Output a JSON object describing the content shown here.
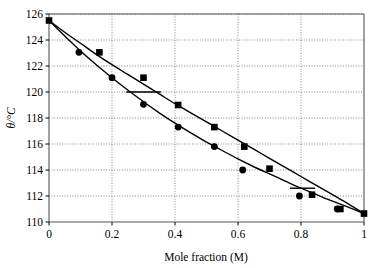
{
  "chart_data": {
    "type": "line",
    "title": "",
    "subtitle": "",
    "xlabel": "Mole fraction (M)",
    "ylabel": "θ/°C",
    "ylabel_parts": {
      "symbol": "θ",
      "unit": "/°C"
    },
    "xlim": [
      0,
      1
    ],
    "ylim": [
      110,
      126
    ],
    "xticks": [
      0,
      0.2,
      0.4,
      0.6,
      0.8,
      1
    ],
    "xtick_labels": [
      "0",
      "0.2",
      "0.4",
      "0.6",
      "0.8",
      "1"
    ],
    "yticks": [
      110,
      112,
      114,
      116,
      118,
      120,
      122,
      124,
      126
    ],
    "ytick_labels": [
      "110",
      "112",
      "114",
      "116",
      "118",
      "120",
      "122",
      "124",
      "126"
    ],
    "grid": "dotted-both",
    "legend": "none",
    "series": [
      {
        "name": "Liquidus (squares)",
        "marker": "square",
        "color": "#000000",
        "x": [
          0,
          0.16,
          0.3,
          0.41,
          0.525,
          0.62,
          0.7,
          0.835,
          0.925,
          1.0
        ],
        "y": [
          125.5,
          123.05,
          121.1,
          119.0,
          117.3,
          115.8,
          114.1,
          112.1,
          111.0,
          110.65
        ]
      },
      {
        "name": "Dew curve (circles)",
        "marker": "circle",
        "color": "#000000",
        "x": [
          0.095,
          0.2,
          0.3,
          0.41,
          0.525,
          0.615,
          0.795,
          0.915
        ],
        "y": [
          123.05,
          121.1,
          119.05,
          117.3,
          115.8,
          114.0,
          112.0,
          111.0
        ]
      }
    ],
    "fitted_curves": [
      {
        "name": "upper-boundary-curve",
        "points": [
          [
            0,
            125.5
          ],
          [
            0.05,
            124.6
          ],
          [
            0.1,
            123.75
          ],
          [
            0.15,
            122.9
          ],
          [
            0.2,
            122.1
          ],
          [
            0.25,
            121.35
          ],
          [
            0.3,
            120.6
          ],
          [
            0.35,
            119.85
          ],
          [
            0.4,
            119.1
          ],
          [
            0.45,
            118.4
          ],
          [
            0.5,
            117.7
          ],
          [
            0.55,
            117.0
          ],
          [
            0.6,
            116.3
          ],
          [
            0.65,
            115.6
          ],
          [
            0.7,
            114.9
          ],
          [
            0.75,
            114.2
          ],
          [
            0.8,
            113.5
          ],
          [
            0.85,
            112.8
          ],
          [
            0.9,
            112.1
          ],
          [
            0.95,
            111.4
          ],
          [
            1.0,
            110.65
          ]
        ]
      },
      {
        "name": "lower-boundary-curve",
        "points": [
          [
            0,
            125.5
          ],
          [
            0.05,
            124.3
          ],
          [
            0.1,
            123.15
          ],
          [
            0.15,
            122.1
          ],
          [
            0.2,
            121.1
          ],
          [
            0.25,
            120.15
          ],
          [
            0.3,
            119.25
          ],
          [
            0.35,
            118.4
          ],
          [
            0.4,
            117.6
          ],
          [
            0.45,
            116.85
          ],
          [
            0.5,
            116.15
          ],
          [
            0.55,
            115.5
          ],
          [
            0.6,
            114.85
          ],
          [
            0.65,
            114.25
          ],
          [
            0.7,
            113.7
          ],
          [
            0.75,
            113.15
          ],
          [
            0.8,
            112.6
          ],
          [
            0.85,
            112.1
          ],
          [
            0.9,
            111.6
          ],
          [
            0.95,
            111.15
          ],
          [
            1.0,
            110.65
          ]
        ]
      }
    ],
    "tie_lines": [
      {
        "name": "tie-line-120",
        "y": 120.0,
        "x_start": 0.245,
        "x_end": 0.355
      },
      {
        "name": "tie-line-112-6",
        "y": 112.6,
        "x_start": 0.765,
        "x_end": 0.845
      }
    ]
  }
}
